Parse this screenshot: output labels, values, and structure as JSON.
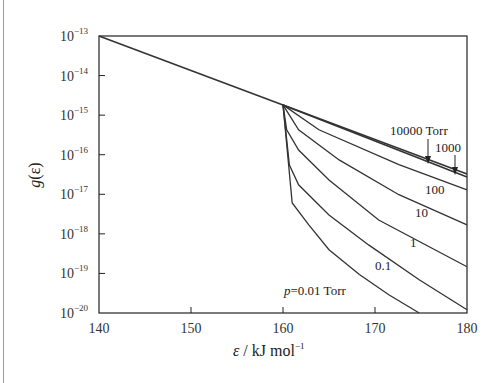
{
  "chart_data": {
    "type": "line",
    "title": "",
    "xlabel": "ε / kJ mol⁻¹",
    "ylabel": "g(ε)",
    "xscale": "linear",
    "yscale": "log",
    "xlim": [
      140,
      180
    ],
    "ylim_exponent": [
      -20,
      -13
    ],
    "grid": false,
    "legend": "inline annotations",
    "x_ticks": [
      140,
      150,
      160,
      170,
      180
    ],
    "y_ticks": [
      "10^-13",
      "10^-14",
      "10^-15",
      "10^-16",
      "10^-17",
      "10^-18",
      "10^-19",
      "10^-20"
    ],
    "common_segment": {
      "name": "all pressures (below threshold)",
      "x": [
        140,
        160
      ],
      "log10_y": [
        -13.0,
        -14.74
      ]
    },
    "series": [
      {
        "name": "10000 Torr",
        "x": [
          160,
          180
        ],
        "log10_y": [
          -14.74,
          -16.49
        ]
      },
      {
        "name": "1000 Torr",
        "x": [
          160,
          180
        ],
        "log10_y": [
          -14.74,
          -16.56
        ]
      },
      {
        "name": "100 Torr",
        "x": [
          160,
          163.9,
          172.6,
          180
        ],
        "log10_y": [
          -14.74,
          -15.37,
          -16.25,
          -16.89
        ]
      },
      {
        "name": "10 Torr",
        "x": [
          160,
          161.7,
          166.1,
          172.6,
          180
        ],
        "log10_y": [
          -14.74,
          -15.37,
          -16.13,
          -17.01,
          -17.77
        ]
      },
      {
        "name": "1 Torr",
        "x": [
          160,
          160.4,
          161.7,
          165.0,
          170.4,
          180
        ],
        "log10_y": [
          -14.74,
          -15.37,
          -15.88,
          -16.64,
          -17.65,
          -18.83
        ]
      },
      {
        "name": "0.1 Torr",
        "x": [
          160,
          160.7,
          161.7,
          165.0,
          169.3,
          174.8,
          180
        ],
        "log10_y": [
          -14.74,
          -16.26,
          -16.76,
          -17.52,
          -18.28,
          -19.16,
          -19.92
        ]
      },
      {
        "name": "0.01 Torr",
        "x": [
          160,
          161.0,
          162.8,
          165.0,
          168.3,
          171.5,
          174.8
        ],
        "log10_y": [
          -14.74,
          -17.22,
          -17.77,
          -18.4,
          -19.03,
          -19.54,
          -20.0
        ]
      }
    ],
    "annotations": [
      {
        "text": "10000 Torr",
        "arrow_to_x": 176.2,
        "target_series": "10000 Torr"
      },
      {
        "text": "1000",
        "arrow_to_x": 179.0,
        "target_series": "1000 Torr"
      },
      {
        "text": "100",
        "near_series": "100 Torr"
      },
      {
        "text": "10",
        "near_series": "10 Torr"
      },
      {
        "text": "1",
        "near_series": "1 Torr"
      },
      {
        "text": "0.1",
        "near_series": "0.1 Torr"
      },
      {
        "text": "p = 0.01 Torr",
        "near_series": "0.01 Torr"
      }
    ]
  },
  "labels": {
    "ylabel_main": "g",
    "ylabel_arg": "(ε)",
    "xlabel_var": "ε",
    "xlabel_unit": " / kJ mol",
    "xlabel_sup": "−1",
    "y_base": "10",
    "y_exps": [
      "−13",
      "−14",
      "−15",
      "−16",
      "−17",
      "−18",
      "−19",
      "−20"
    ],
    "x_ticks": [
      "140",
      "150",
      "160",
      "170",
      "180"
    ],
    "ann_10000": "10000 Torr",
    "ann_1000": "1000",
    "ann_100": "100",
    "ann_10": "10",
    "ann_1": "1",
    "ann_01": "0.1",
    "ann_p": "p",
    "ann_001": "=0.01 Torr"
  }
}
